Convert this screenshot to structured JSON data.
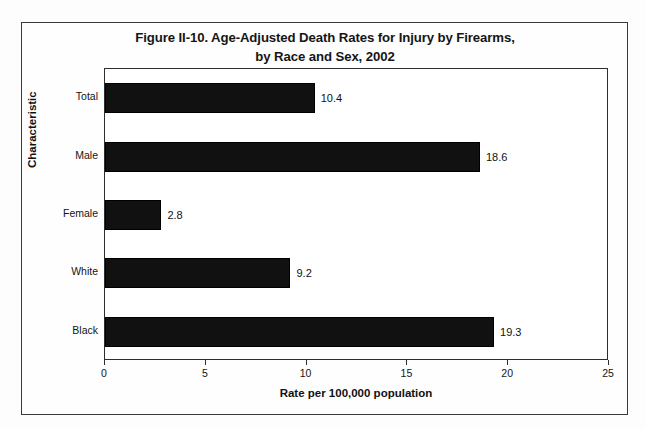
{
  "figure": {
    "title_line1": "Figure II-10. Age-Adjusted Death Rates for Injury by Firearms,",
    "title_line2": "by Race and Sex, 2002"
  },
  "chart_data": {
    "type": "bar",
    "orientation": "horizontal",
    "title": "Figure II-10. Age-Adjusted Death Rates for Injury by Firearms, by Race and Sex, 2002",
    "xlabel": "Rate per 100,000 population",
    "ylabel": "Characteristic",
    "categories": [
      "Total",
      "Male",
      "Female",
      "White",
      "Black"
    ],
    "values": [
      10.4,
      18.6,
      2.8,
      9.2,
      19.3
    ],
    "value_labels": [
      "10.4",
      "18.6",
      "2.8",
      "9.2",
      "19.3"
    ],
    "xlim": [
      0,
      25
    ],
    "xticks": [
      0,
      5,
      10,
      15,
      20,
      25
    ],
    "xtick_labels": [
      "0",
      "5",
      "10",
      "15",
      "20",
      "25"
    ],
    "grid": false,
    "legend": false,
    "bar_color": "#111111",
    "plot_border_color": "#2e2e2e",
    "background_color": "#ffffff"
  }
}
